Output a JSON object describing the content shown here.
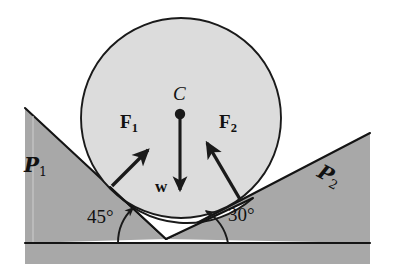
{
  "figure": {
    "type": "physics-free-body-diagram",
    "colors": {
      "background": "#ffffff",
      "plane_fill": "#a8a8a8",
      "cylinder_fill": "#dcdcdc",
      "ink": "#111111",
      "ground_fill": "#a8a8a8"
    }
  },
  "labels": {
    "plane1": {
      "symbol": "P",
      "subscript": "1",
      "text": "P1"
    },
    "plane2": {
      "symbol": "P",
      "subscript": "2",
      "text": "P2"
    },
    "force1": {
      "symbol": "F",
      "subscript": "1",
      "text": "F1"
    },
    "force2": {
      "symbol": "F",
      "subscript": "2",
      "text": "F2"
    },
    "weight": {
      "text": "w"
    },
    "center": {
      "text": "C"
    },
    "angle1": {
      "text": "45°",
      "value": 45,
      "unit": "degrees"
    },
    "angle2": {
      "text": "30°",
      "value": 30,
      "unit": "degrees"
    }
  },
  "geometry": {
    "cylinder": {
      "center_x": 181,
      "center_y": 118,
      "radius": 100
    },
    "groove_apex": {
      "x": 166,
      "y": 239
    },
    "ground_line_y": 243,
    "left_incline_angle_deg": 45,
    "right_incline_angle_deg": 30,
    "weight_vector": {
      "from_x": 180,
      "from_y": 115,
      "to_x": 180,
      "to_y": 192,
      "direction": "down"
    },
    "force1_vector": {
      "from_x": 112,
      "from_y": 186,
      "to_x": 148,
      "to_y": 150,
      "direction_deg": 45
    },
    "force2_vector": {
      "from_x": 241,
      "from_y": 201,
      "to_x": 206,
      "to_y": 142,
      "direction_deg": 120
    }
  },
  "icons": {
    "center_point": "filled-dot-icon",
    "arrow_head": "arrowhead-icon",
    "angle_arc": "arc-arrow-icon"
  }
}
